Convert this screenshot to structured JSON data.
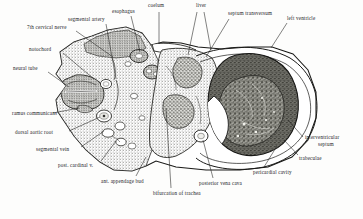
{
  "figure": {
    "kind": "anatomical-cross-section",
    "background_color": "#fdfdfc",
    "ink_color": "#20201e"
  },
  "labels": [
    {
      "id": "coelum",
      "text": "coelum",
      "x": 148,
      "y": 3,
      "align": "left"
    },
    {
      "id": "liver",
      "text": "liver",
      "x": 196,
      "y": 3,
      "align": "left"
    },
    {
      "id": "esophagus",
      "text": "esophagus",
      "x": 112,
      "y": 9,
      "align": "left"
    },
    {
      "id": "septum-transversum",
      "text": "septum transversum",
      "x": 228,
      "y": 11,
      "align": "left"
    },
    {
      "id": "left-ventricle",
      "text": "left ventricle",
      "x": 287,
      "y": 16,
      "align": "left"
    },
    {
      "id": "segmental-artery",
      "text": "segmental artery",
      "x": 68,
      "y": 17,
      "align": "left"
    },
    {
      "id": "seventh-cervical-nerve",
      "text": "7th cervical nerve",
      "x": 27,
      "y": 25,
      "align": "left"
    },
    {
      "id": "notochord",
      "text": "notochord",
      "x": 29,
      "y": 47,
      "align": "left"
    },
    {
      "id": "neural-tube",
      "text": "neural  tube",
      "x": 13,
      "y": 66,
      "align": "left"
    },
    {
      "id": "ramus-communicans",
      "text": "ramus communicans",
      "x": 12,
      "y": 111,
      "align": "left"
    },
    {
      "id": "dorsal-aortic-root",
      "text": "dorsal  aortic  root",
      "x": 15,
      "y": 130,
      "align": "left"
    },
    {
      "id": "segmental-vein",
      "text": "segmental vein",
      "x": 36,
      "y": 147,
      "align": "left"
    },
    {
      "id": "post-cardinal-v",
      "text": "post. cardinal v.",
      "x": 58,
      "y": 163,
      "align": "left"
    },
    {
      "id": "ant-appendage-bud",
      "text": "ant. appendage bud",
      "x": 101,
      "y": 179,
      "align": "left"
    },
    {
      "id": "bifurcation-of-trachea",
      "text": "bifurcation of trachea",
      "x": 153,
      "y": 191,
      "align": "left"
    },
    {
      "id": "posterior-vena-cava",
      "text": "posterior  vena cava",
      "x": 199,
      "y": 181,
      "align": "left"
    },
    {
      "id": "pericardial-cavity",
      "text": "pericardial cavity",
      "x": 253,
      "y": 170,
      "align": "left"
    },
    {
      "id": "trabeculae",
      "text": "trabeculae",
      "x": 299,
      "y": 156,
      "align": "left"
    },
    {
      "id": "interventricular-septum-l1",
      "text": "interventricular",
      "x": 305,
      "y": 135,
      "align": "left"
    },
    {
      "id": "interventricular-septum-l2",
      "text": "septum",
      "x": 318,
      "y": 142,
      "align": "left"
    }
  ],
  "leaders": [
    {
      "id": "leader-coelum",
      "points": "159,12 159,44"
    },
    {
      "id": "leader-liver-a",
      "points": "197,12 188,55"
    },
    {
      "id": "leader-liver-b",
      "points": "204,12 211,50"
    },
    {
      "id": "leader-esophagus",
      "points": "131,16 140,52"
    },
    {
      "id": "leader-septum-transversum",
      "points": "229,19 206,57"
    },
    {
      "id": "leader-left-ventricle",
      "points": "287,23 271,48"
    },
    {
      "id": "leader-segmental-artery",
      "points": "106,24 116,79"
    },
    {
      "id": "leader-7th-cervical-nerve",
      "points": "76,31 113,57"
    },
    {
      "id": "leader-notochord",
      "points": "63,53 94,79"
    },
    {
      "id": "leader-neural-tube",
      "points": "48,72 69,87"
    },
    {
      "id": "leader-ramus-communicans",
      "points": "53,113 79,108"
    },
    {
      "id": "leader-dorsal-aortic-root",
      "points": "69,131 100,117"
    },
    {
      "id": "leader-segmental-vein",
      "points": "81,147 104,131"
    },
    {
      "id": "leader-post-cardinal-v",
      "points": "101,161 116,141"
    },
    {
      "id": "leader-ant-appendage-bud",
      "points": "136,176 146,157"
    },
    {
      "id": "leader-bifurcation",
      "points": "171,188 166,108"
    },
    {
      "id": "leader-posterior-vena-cava",
      "points": "213,178 203,140"
    },
    {
      "id": "leader-pericardial-cavity",
      "points": "264,167 277,146"
    },
    {
      "id": "leader-trabeculae",
      "points": "298,155 284,140"
    },
    {
      "id": "leader-interventricular",
      "points": "303,137 288,120"
    }
  ]
}
